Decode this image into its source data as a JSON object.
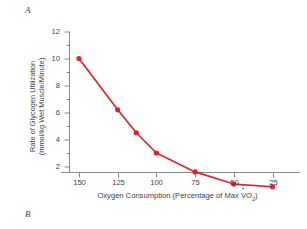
{
  "figure": {
    "panel_a_label": "A",
    "panel_b_label": "B"
  },
  "chart_data": {
    "type": "line",
    "title": "",
    "subtitle": "",
    "xlabel_prefix": "Oxygen Consumption (Percentage of Max ",
    "xlabel_symbol": "V",
    "xlabel_symbol_sub": "O",
    "xlabel_sub": "2",
    "xlabel_suffix": ")",
    "xlabel": "Oxygen Consumption (Percentage of Max VO2)",
    "ylabel_line1": "Rate of Glycogen Utilization",
    "ylabel_line2": "(mmol/kg Wet Muscle/Minute)",
    "ylabel": "Rate of Glycogen Utilization (mmol/kg Wet Muscle/Minute)",
    "x": [
      150,
      125,
      113,
      100,
      75,
      50,
      25
    ],
    "values": [
      10.0,
      6.2,
      4.5,
      3.0,
      1.6,
      0.7,
      0.5
    ],
    "xtick_labels": [
      "150",
      "125",
      "100",
      "75",
      "50",
      "25"
    ],
    "xtick_values": [
      150,
      125,
      100,
      75,
      50,
      25
    ],
    "ytick_labels": [
      "12",
      "10",
      "8",
      "6",
      "4",
      "2"
    ],
    "ytick_values": [
      12,
      10,
      8,
      6,
      4,
      2
    ],
    "xlim": [
      160,
      15
    ],
    "ylim": [
      0,
      12.8
    ],
    "x_axis_inverted": true,
    "grid": false,
    "legend": "none",
    "series_color": "#d7262c",
    "axis_color": "#8a8a8a",
    "text_color": "#3f3f3f",
    "marker": "circle",
    "marker_size": 5.2,
    "line_width": 1.7,
    "y_minor_ticks": true
  }
}
